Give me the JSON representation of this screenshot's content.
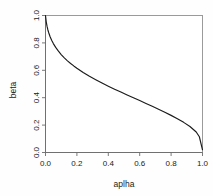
{
  "chart_data": {
    "type": "line",
    "title": "",
    "subtitle": "",
    "xlabel": "aplha",
    "ylabel": "beta",
    "xlim": [
      0.0,
      1.0
    ],
    "ylim": [
      0.0,
      1.0
    ],
    "grid": false,
    "legend": null,
    "annotations": [],
    "xticks": [
      "0.0",
      "0.2",
      "0.4",
      "0.6",
      "0.8",
      "1.0"
    ],
    "xtick_values": [
      0.0,
      0.2,
      0.4,
      0.6,
      0.8,
      1.0
    ],
    "yticks": [
      "0.0",
      "0.2",
      "0.4",
      "0.6",
      "0.8",
      "1.0"
    ],
    "ytick_values": [
      0.0,
      0.2,
      0.4,
      0.6,
      0.8,
      1.0
    ],
    "series": [
      {
        "name": "beta vs alpha",
        "color": "#1a1a1a",
        "x": [
          0.0,
          0.005,
          0.01,
          0.015,
          0.02,
          0.03,
          0.04,
          0.05,
          0.065,
          0.08,
          0.1,
          0.12,
          0.14,
          0.16,
          0.18,
          0.2,
          0.24,
          0.28,
          0.32,
          0.36,
          0.4,
          0.44,
          0.48,
          0.52,
          0.56,
          0.6,
          0.64,
          0.68,
          0.72,
          0.76,
          0.8,
          0.84,
          0.88,
          0.92,
          0.96,
          0.98,
          1.0
        ],
        "y": [
          1.0,
          0.952,
          0.92,
          0.896,
          0.876,
          0.843,
          0.817,
          0.795,
          0.767,
          0.743,
          0.715,
          0.691,
          0.669,
          0.65,
          0.632,
          0.615,
          0.584,
          0.556,
          0.531,
          0.507,
          0.484,
          0.462,
          0.441,
          0.42,
          0.399,
          0.379,
          0.358,
          0.337,
          0.316,
          0.294,
          0.271,
          0.247,
          0.22,
          0.19,
          0.15,
          0.115,
          0.02
        ]
      }
    ]
  },
  "axes": {
    "x_title": "aplha",
    "y_title": "beta"
  }
}
